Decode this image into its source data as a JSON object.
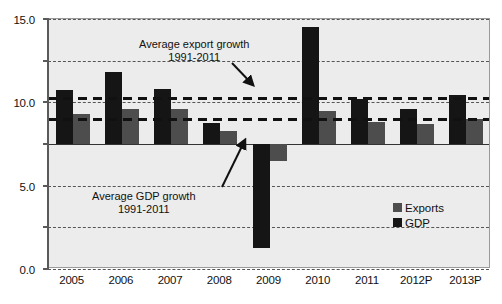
{
  "chart_data": {
    "type": "bar",
    "title": "",
    "subtitle": "",
    "xlabel": "",
    "ylabel": "",
    "categories": [
      "2005",
      "2006",
      "2007",
      "2008",
      "2009",
      "2010",
      "2011",
      "2012P",
      "2013P"
    ],
    "series": [
      {
        "name": "GDP",
        "color": "#151515",
        "values": [
          6.5,
          8.7,
          6.6,
          2.5,
          -12.5,
          14.0,
          5.4,
          4.2,
          5.9
        ]
      },
      {
        "name": "Exports",
        "color": "#4d4d4d",
        "values": [
          3.6,
          4.2,
          4.2,
          1.6,
          -2.0,
          4.0,
          2.7,
          2.4,
          3.0
        ]
      }
    ],
    "ylim": [
      -15.0,
      15.0
    ],
    "yticks": [
      15.0,
      10.0,
      5.0,
      0.0,
      -5.0,
      -10.0,
      -15.0
    ],
    "ytick_labels": [
      "15.0",
      "10.0",
      "5.0",
      "0.0",
      "-5.0",
      "-10.0",
      "-15.0"
    ],
    "grid": true,
    "legend_position": "inside-right-lower",
    "reference_lines": [
      {
        "id": "avg-export-growth",
        "label": "Average export growth",
        "sublabel": "1991-2011",
        "value": 5.5,
        "style": "thick-dashed"
      },
      {
        "id": "avg-gdp-growth",
        "label": "Average GDP growth",
        "sublabel": "1991-2011",
        "value": 3.0,
        "style": "thick-dashed"
      }
    ],
    "annotations": [
      {
        "id": "annotation-export",
        "line1": "Average export growth",
        "line2": "1991-2011"
      },
      {
        "id": "annotation-gdp",
        "line1": "Average GDP growth",
        "line2": "1991-2011"
      }
    ]
  },
  "legend": {
    "items": [
      {
        "label": "Exports",
        "swatch": "exports"
      },
      {
        "label": "GDP",
        "swatch": "gdp"
      }
    ]
  },
  "colors": {
    "plot_background": "#ececec",
    "gdp": "#151515",
    "exports": "#4d4d4d",
    "axis": "#5a5a5a",
    "grid": "#555555"
  }
}
